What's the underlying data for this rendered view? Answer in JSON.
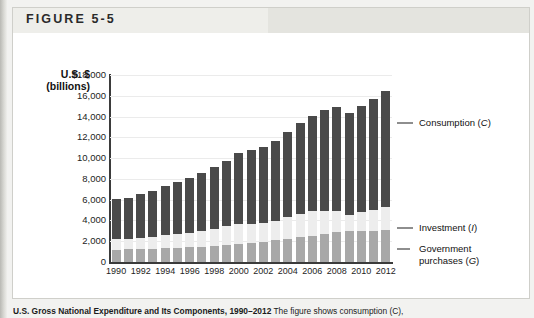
{
  "figure": {
    "header_label": "FIGURE 5-5",
    "caption_bold": "U.S. Gross National Expenditure and Its Components, 1990–2012",
    "caption_rest": " The figure shows consumption (C),"
  },
  "axis_title": {
    "line1": "U.S. $",
    "line2": "(billions)"
  },
  "legend": [
    {
      "name": "consumption",
      "label": "Consumption (C)",
      "color": "#4a4a4a"
    },
    {
      "name": "investment",
      "label": "Investment (I)",
      "color": "#ededed"
    },
    {
      "name": "government-purchases",
      "label": "Government purchases (G)",
      "color": "#a8a8a8"
    }
  ],
  "colors": {
    "consumption": "#4a4a4a",
    "investment": "#ededed",
    "government": "#a8a8a8",
    "axis": "#3b3b3b",
    "grid": "#ebebeb",
    "header_band": "#e4e4df"
  },
  "chart_data": {
    "type": "bar",
    "stacked": true,
    "xlabel": "",
    "ylabel": "U.S. $ (billions)",
    "ylim": [
      0,
      18000
    ],
    "ytick_labels": [
      "$18,000",
      "16,000",
      "14,000",
      "12,000",
      "10,000",
      "8,000",
      "6,000",
      "4,000",
      "2,000",
      "0"
    ],
    "yticks": [
      18000,
      16000,
      14000,
      12000,
      10000,
      8000,
      6000,
      4000,
      2000,
      0
    ],
    "grid": true,
    "legend_position": "right",
    "categories": [
      1990,
      1991,
      1992,
      1993,
      1994,
      1995,
      1996,
      1997,
      1998,
      1999,
      2000,
      2001,
      2002,
      2003,
      2004,
      2005,
      2006,
      2007,
      2008,
      2009,
      2010,
      2011,
      2012
    ],
    "xtick_labels": [
      "1990",
      "1992",
      "1994",
      "1996",
      "1998",
      "2000",
      "2002",
      "2004",
      "2006",
      "2008",
      "2010",
      "2012"
    ],
    "series": [
      {
        "name": "Government purchases (G)",
        "key": "government",
        "values": [
          1180,
          1230,
          1270,
          1290,
          1320,
          1370,
          1410,
          1460,
          1520,
          1620,
          1720,
          1830,
          1960,
          2080,
          2210,
          2360,
          2500,
          2650,
          2870,
          2950,
          3020,
          3020,
          3060
        ]
      },
      {
        "name": "Investment (I)",
        "key": "investment",
        "values": [
          1030,
          950,
          1010,
          1110,
          1270,
          1310,
          1420,
          1570,
          1690,
          1840,
          1980,
          1840,
          1800,
          1870,
          2080,
          2280,
          2400,
          2300,
          2080,
          1580,
          1830,
          1980,
          2240
        ]
      },
      {
        "name": "Consumption (C)",
        "key": "consumption",
        "values": [
          3830,
          4020,
          4240,
          4480,
          4740,
          4990,
          5270,
          5570,
          5900,
          6310,
          6790,
          7070,
          7350,
          7700,
          8200,
          8700,
          9200,
          9700,
          9980,
          9850,
          10200,
          10700,
          11120
        ]
      }
    ],
    "totals": [
      6040,
      6200,
      6520,
      6880,
      7330,
      7670,
      8100,
      8600,
      9110,
      9770,
      10490,
      10740,
      11110,
      11650,
      12490,
      13340,
      14100,
      14650,
      14930,
      14380,
      15050,
      15700,
      16420
    ]
  }
}
